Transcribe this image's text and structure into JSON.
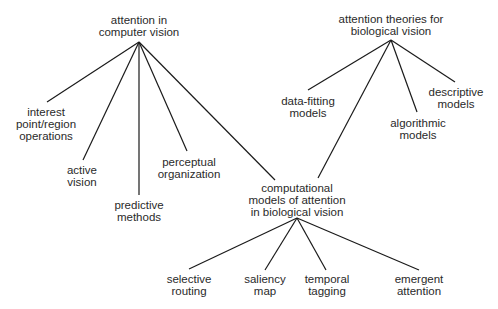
{
  "diagram": {
    "type": "tree",
    "nodes": [
      {
        "id": "cv",
        "lines": [
          "attention in",
          "computer vision"
        ],
        "x": 139,
        "y": 14,
        "apex": [
          139,
          42
        ]
      },
      {
        "id": "ip",
        "lines": [
          "interest",
          "point/region",
          "operations"
        ],
        "x": 46,
        "y": 106
      },
      {
        "id": "av",
        "lines": [
          "active",
          "vision"
        ],
        "x": 82,
        "y": 164
      },
      {
        "id": "pm",
        "lines": [
          "predictive",
          "methods"
        ],
        "x": 139,
        "y": 199
      },
      {
        "id": "po",
        "lines": [
          "perceptual",
          "organization"
        ],
        "x": 189,
        "y": 156
      },
      {
        "id": "bio",
        "lines": [
          "attention theories for",
          "biological vision"
        ],
        "x": 391,
        "y": 13,
        "apex": [
          391,
          40
        ]
      },
      {
        "id": "df",
        "lines": [
          "data-fitting",
          "models"
        ],
        "x": 308,
        "y": 95
      },
      {
        "id": "al",
        "lines": [
          "algorithmic",
          "models"
        ],
        "x": 418,
        "y": 117
      },
      {
        "id": "de",
        "lines": [
          "descriptive",
          "models"
        ],
        "x": 456,
        "y": 86
      },
      {
        "id": "cm",
        "lines": [
          "computational",
          "models of attention",
          "in biological vision"
        ],
        "x": 297,
        "y": 182,
        "apex": [
          297,
          218
        ]
      },
      {
        "id": "sr",
        "lines": [
          "selective",
          "routing"
        ],
        "x": 189,
        "y": 273
      },
      {
        "id": "sm",
        "lines": [
          "saliency",
          "map"
        ],
        "x": 265,
        "y": 273
      },
      {
        "id": "tt",
        "lines": [
          "temporal",
          "tagging"
        ],
        "x": 327,
        "y": 273
      },
      {
        "id": "ea",
        "lines": [
          "emergent",
          "attention"
        ],
        "x": 419,
        "y": 273
      }
    ],
    "edges": [
      {
        "from": [
          139,
          42
        ],
        "to": [
          47,
          102
        ]
      },
      {
        "from": [
          139,
          42
        ],
        "to": [
          83,
          160
        ]
      },
      {
        "from": [
          139,
          42
        ],
        "to": [
          139,
          195
        ]
      },
      {
        "from": [
          139,
          42
        ],
        "to": [
          187,
          151
        ]
      },
      {
        "from": [
          139,
          42
        ],
        "to": [
          275,
          180
        ]
      },
      {
        "from": [
          391,
          40
        ],
        "to": [
          308,
          90
        ]
      },
      {
        "from": [
          391,
          40
        ],
        "to": [
          417,
          112
        ]
      },
      {
        "from": [
          391,
          40
        ],
        "to": [
          455,
          82
        ]
      },
      {
        "from": [
          391,
          40
        ],
        "to": [
          318,
          178
        ]
      },
      {
        "from": [
          297,
          218
        ],
        "to": [
          189,
          269
        ]
      },
      {
        "from": [
          297,
          218
        ],
        "to": [
          265,
          270
        ]
      },
      {
        "from": [
          297,
          218
        ],
        "to": [
          326,
          270
        ]
      },
      {
        "from": [
          297,
          218
        ],
        "to": [
          419,
          270
        ]
      }
    ],
    "line_color": "#1a1a1a",
    "text_color": "#2a2a2a"
  }
}
